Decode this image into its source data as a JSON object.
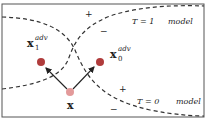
{
  "diagram": {
    "type": "decision-boundaries-adversarial",
    "frame": {
      "x": 2,
      "y": 4,
      "width": 202,
      "height": 113,
      "stroke": "#555555"
    },
    "boundaries": [
      {
        "id": "t1-boundary",
        "label": "T = 1",
        "suffix": "model",
        "label_pos": [
          132,
          23
        ]
      },
      {
        "id": "t0-boundary",
        "label": "T = 0",
        "suffix": "model",
        "label_pos": [
          137,
          103
        ]
      }
    ],
    "points": [
      {
        "id": "x",
        "label": "x",
        "sup": "",
        "sub": "",
        "pos": [
          70,
          92
        ],
        "color": "#e39a9a"
      },
      {
        "id": "x1-adv",
        "label": "x",
        "sub": "1",
        "sup": "adv",
        "pos": [
          41,
          62
        ],
        "color": "#b33a3a"
      },
      {
        "id": "x0-adv",
        "label": "x",
        "sub": "0",
        "sup": "adv",
        "pos": [
          100,
          62
        ],
        "color": "#b33a3a"
      }
    ],
    "signs": [
      {
        "text": "+",
        "pos": [
          88,
          17
        ]
      },
      {
        "text": "−",
        "pos": [
          103,
          34
        ]
      },
      {
        "text": "+",
        "pos": [
          122,
          92
        ]
      },
      {
        "text": "−",
        "pos": [
          113,
          111
        ]
      }
    ],
    "arrows": [
      {
        "from": "x",
        "to": "x1-adv"
      },
      {
        "from": "x",
        "to": "x0-adv"
      }
    ]
  }
}
